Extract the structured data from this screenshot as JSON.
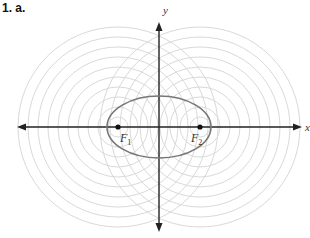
{
  "heading": "1. a.",
  "diagram": {
    "axes": {
      "x_label": "x",
      "y_label": "y",
      "origin": [
        159,
        127
      ],
      "x_range_px": [
        17,
        302
      ],
      "y_range_px": [
        22,
        232
      ],
      "color": "#222222"
    },
    "ellipse": {
      "cx": 159,
      "cy": 127,
      "rx": 52,
      "ry": 31,
      "color": "#777777"
    },
    "foci": [
      {
        "label": "F",
        "sub": "1",
        "x": 118,
        "y": 127
      },
      {
        "label": "F",
        "sub": "2",
        "x": 200,
        "y": 127
      }
    ],
    "concentric_circles": {
      "radii": [
        10,
        20,
        30,
        40,
        50,
        60,
        70,
        80,
        90,
        100
      ],
      "color": "#d9d9d9"
    }
  }
}
